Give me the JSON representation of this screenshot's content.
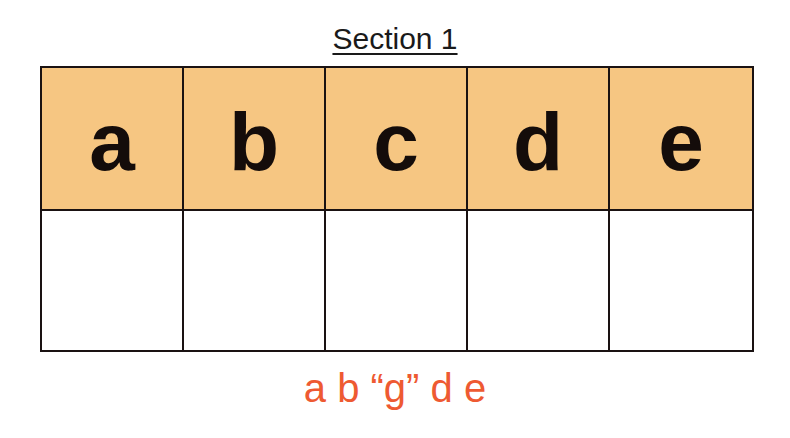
{
  "title": "Section 1",
  "letters": [
    "a",
    "b",
    "c",
    "d",
    "e"
  ],
  "answer_boxes": [
    "",
    "",
    "",
    "",
    ""
  ],
  "answer_text": "a b “g” d e",
  "colors": {
    "header_fill": "#f6c682",
    "border": "#1a1212",
    "answer_text": "#ee5a32"
  }
}
